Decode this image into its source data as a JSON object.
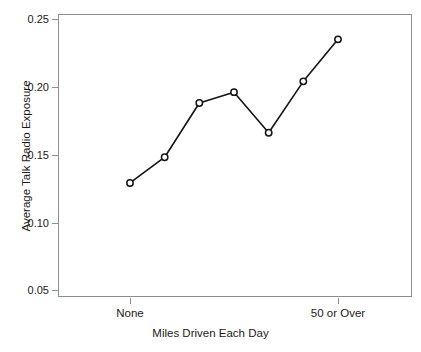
{
  "chart_data": {
    "type": "line",
    "title": "",
    "xlabel": "Miles Driven Each Day",
    "ylabel": "Average Talk Radio Exposure",
    "categories": [
      "None",
      "",
      "",
      "",
      "",
      "",
      "50 or Over"
    ],
    "x": [
      1,
      2,
      3,
      4,
      5,
      6,
      7
    ],
    "values": [
      0.129,
      0.148,
      0.188,
      0.196,
      0.166,
      0.204,
      0.235
    ],
    "series": [
      {
        "name": "Average Talk Radio Exposure",
        "values": [
          0.129,
          0.148,
          0.188,
          0.196,
          0.166,
          0.204,
          0.235
        ]
      }
    ],
    "ylim": [
      0.0385,
      0.2565
    ],
    "xlim": [
      0.5,
      7.5
    ],
    "yticks": [
      0.05,
      0.1,
      0.15,
      0.2,
      0.25
    ],
    "ytick_labels": [
      "0.05",
      "0.10",
      "0.15",
      "0.20",
      "0.25"
    ],
    "xticks": [
      1,
      7
    ],
    "xtick_labels": [
      "None",
      "50 or Over"
    ],
    "grid": false,
    "legend": false,
    "legend_position": "none",
    "marker": "circle-open",
    "line_color": "#141414",
    "marker_face_color": "#ffffff",
    "marker_edge_color": "#141414",
    "frame_color": "#8e8e8e",
    "background_color": "#ffffff"
  },
  "axes": {
    "y_title": "Average Talk Radio Exposure",
    "x_title": "Miles Driven Each Day",
    "y_labels": [
      "0.25",
      "0.20",
      "0.15",
      "0.10",
      "0.05"
    ],
    "x_labels": [
      "None",
      "50 or Over"
    ]
  }
}
